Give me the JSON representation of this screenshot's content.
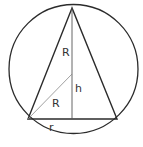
{
  "diagram": {
    "colors": {
      "stroke": "#2b2b2b",
      "thin_stroke": "#777777",
      "background": "#ffffff",
      "label": "#333333"
    },
    "circle": {
      "cx": 73.5,
      "cy": 69,
      "r": 64.5
    },
    "triangle": {
      "apex": [
        72,
        8
      ],
      "base_left": [
        28,
        119
      ],
      "base_right": [
        117,
        119
      ]
    },
    "altitude": {
      "x": 72,
      "y1": 8,
      "y2": 119
    },
    "radius_line": {
      "from": [
        28,
        119
      ],
      "to": [
        72,
        74
      ]
    },
    "labels": {
      "upper_radius": "R",
      "lower_radius": "R",
      "height": "h",
      "base_half": "r"
    }
  }
}
